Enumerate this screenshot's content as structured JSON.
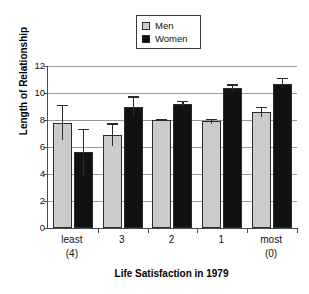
{
  "chart_data": {
    "type": "bar",
    "title": "",
    "xlabel": "Life Satisfaction in 1979",
    "ylabel": "Length of Relationship",
    "categories": [
      "least\n(4)",
      "3",
      "2",
      "1",
      "most\n(0)"
    ],
    "category_lines": [
      {
        "line1": "least",
        "line2": "(4)"
      },
      {
        "line1": "3",
        "line2": ""
      },
      {
        "line1": "2",
        "line2": ""
      },
      {
        "line1": "1",
        "line2": ""
      },
      {
        "line1": "most",
        "line2": "(0)"
      }
    ],
    "ylim": [
      0,
      12
    ],
    "yticks": [
      0,
      2,
      4,
      6,
      8,
      10,
      12
    ],
    "ytick_labels": [
      "0",
      "2",
      "4",
      "6",
      "8",
      "10",
      "12"
    ],
    "grid": true,
    "legend_position": "top-center",
    "series": [
      {
        "name": "Men",
        "color": "#cbcbcb",
        "values": [
          7.75,
          6.9,
          8.0,
          7.9,
          8.6
        ],
        "err_low": [
          1.2,
          0.85,
          0.1,
          0.2,
          0.35
        ],
        "err_high": [
          1.35,
          0.85,
          0.1,
          0.2,
          0.35
        ]
      },
      {
        "name": "Women",
        "color": "#111111",
        "values": [
          5.6,
          9.0,
          9.2,
          10.4,
          10.7
        ],
        "err_low": [
          1.75,
          0.75,
          0.2,
          0.25,
          0.4
        ],
        "err_high": [
          1.75,
          0.75,
          0.2,
          0.25,
          0.4
        ]
      }
    ]
  },
  "legend": {
    "items": [
      {
        "label": "Men",
        "swatch": "men"
      },
      {
        "label": "Women",
        "swatch": "women"
      }
    ]
  }
}
